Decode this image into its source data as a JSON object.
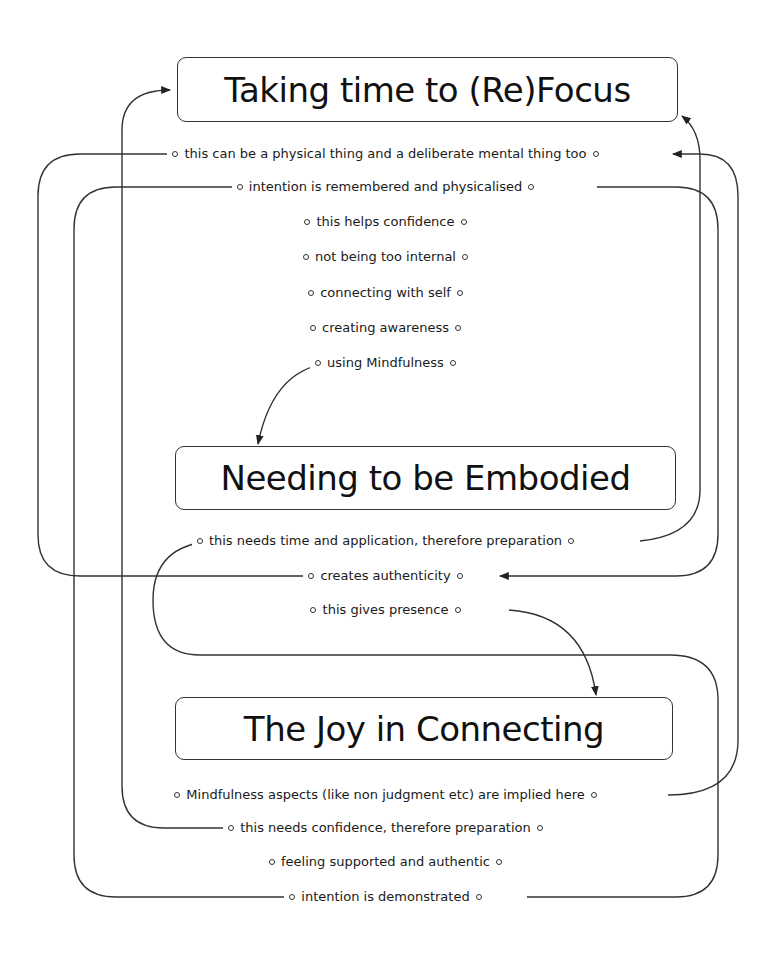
{
  "diagram": {
    "type": "concept-map",
    "themes": [
      {
        "id": "t1",
        "label": "Taking time to (Re)Focus"
      },
      {
        "id": "t2",
        "label": "Needing to be Embodied"
      },
      {
        "id": "t3",
        "label": "The Joy in Connecting"
      }
    ],
    "notes": {
      "t1": [
        "this can be a physical thing and a deliberate mental thing too",
        "intention is remembered and physicalised",
        "this helps confidence",
        "not being too internal",
        "connecting with self",
        "creating awareness",
        "using Mindfulness"
      ],
      "t2": [
        "this needs time and application, therefore preparation",
        "creates authenticity",
        "this gives presence"
      ],
      "t3": [
        "Mindfulness aspects (like non judgment etc) are implied here",
        "this needs confidence, therefore preparation",
        "feeling supported and authentic",
        "intention is demonstrated"
      ]
    },
    "links": [
      {
        "from": "this can be a physical thing and a deliberate mental thing too",
        "to": "creates authenticity"
      },
      {
        "from": "intention is remembered and physicalised",
        "to": "creates authenticity"
      },
      {
        "from": "using Mindfulness",
        "to": "Needing to be Embodied"
      },
      {
        "from": "this needs time and application, therefore preparation",
        "to": "Taking time to (Re)Focus"
      },
      {
        "from": "this gives presence",
        "to": "The Joy in Connecting"
      },
      {
        "from": "Mindfulness aspects (like non judgment etc) are implied here",
        "to": "this can be a physical thing and a deliberate mental thing too"
      },
      {
        "from": "this needs confidence, therefore preparation",
        "to": "Taking time to (Re)Focus"
      },
      {
        "from": "intention is demonstrated",
        "to": "intention is remembered and physicalised"
      },
      {
        "from": "intention is demonstrated",
        "to": "this needs time and application, therefore preparation"
      }
    ],
    "line_color": "#333333",
    "box_border_color": "#333333"
  }
}
